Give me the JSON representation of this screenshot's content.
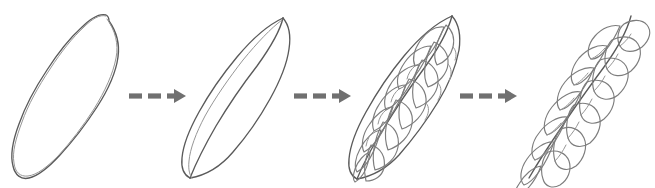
{
  "figure": {
    "type": "botanical-progression-diagram",
    "title": "Leaf morphology progression",
    "background_color": "#ffffff",
    "stroke_color": "#5a5a5a",
    "arrow_color": "#707070",
    "stage_count": 4,
    "arrow_count": 3,
    "style": "hand-drawn pencil sketch, no labels or text"
  },
  "stages": [
    {
      "index": 1,
      "name": "simple-ellipse-outline",
      "description": "Plain tilted ellipse outline representing an entire undivided leaf blade",
      "center_x": 68,
      "center_y": 94,
      "radius_x": 42,
      "radius_y": 86,
      "rotation_deg": 28,
      "has_midrib": false,
      "vein_pair_count": 0,
      "leaflet_count": 0
    },
    {
      "index": 2,
      "name": "pointed-blade-with-midrib",
      "description": "Lens-shaped pointed leaf blade with a single curved midrib",
      "center_x": 240,
      "center_y": 94,
      "radius_x": 40,
      "radius_y": 86,
      "rotation_deg": 25,
      "has_midrib": true,
      "vein_pair_count": 0,
      "leaflet_count": 0
    },
    {
      "index": 3,
      "name": "pinnately-veined-lobed-blade",
      "description": "Leaf blade with midrib and pinnate lateral vein loops forming incipient lobes",
      "center_x": 410,
      "center_y": 94,
      "radius_x": 42,
      "radius_y": 86,
      "rotation_deg": 25,
      "has_midrib": true,
      "vein_pair_count": 8,
      "leaflet_count": 0
    },
    {
      "index": 4,
      "name": "compound-pinnate-leaf",
      "description": "Fully dissected compound leaf with separate free leaflets along a rachis",
      "center_x": 578,
      "center_y": 94,
      "radius_x": 44,
      "radius_y": 86,
      "rotation_deg": 25,
      "has_midrib": true,
      "vein_pair_count": 0,
      "leaflet_count": 9
    }
  ],
  "arrows": [
    {
      "index": 1,
      "name": "arrow-stage1-to-stage2",
      "from_stage": 1,
      "to_stage": 2,
      "x_start": 128,
      "x_end": 183,
      "y": 96,
      "style": "dashed",
      "dash_count": 3,
      "direction": "right"
    },
    {
      "index": 2,
      "name": "arrow-stage2-to-stage3",
      "from_stage": 2,
      "to_stage": 3,
      "x_start": 292,
      "x_end": 348,
      "y": 96,
      "style": "dashed",
      "dash_count": 3,
      "direction": "right"
    },
    {
      "index": 3,
      "name": "arrow-stage3-to-stage4",
      "from_stage": 3,
      "to_stage": 4,
      "x_start": 458,
      "x_end": 514,
      "y": 96,
      "style": "dashed",
      "dash_count": 3,
      "direction": "right"
    }
  ]
}
